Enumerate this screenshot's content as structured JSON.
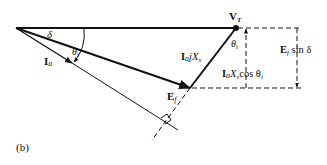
{
  "figure": {
    "panel_label": "(b)",
    "labels": {
      "vt_main": "V",
      "vt_sub": "T",
      "delta": "δ",
      "theta_i_origin": "θ",
      "theta_i_origin_sub": "i",
      "theta_i_vt": "θ",
      "theta_i_vt_sub": "i",
      "ia_main": "I",
      "ia_sub": "a",
      "iajxs_I": "I",
      "iajxs_a": "a",
      "iajxs_jX": "jX",
      "iajxs_s": "s",
      "ef_main": "E",
      "ef_sub": "f",
      "efsind_E": "E",
      "efsind_f": "f",
      "efsind_rest": " sin δ",
      "iaxscos_I": "I",
      "iaxscos_a": "a",
      "iaxscos_X": "X",
      "iaxscos_s": "s",
      "iaxscos_rest": "cos θ",
      "iaxscos_i": "i"
    },
    "colors": {
      "stroke": "#111111",
      "background": "#ffffff"
    }
  }
}
